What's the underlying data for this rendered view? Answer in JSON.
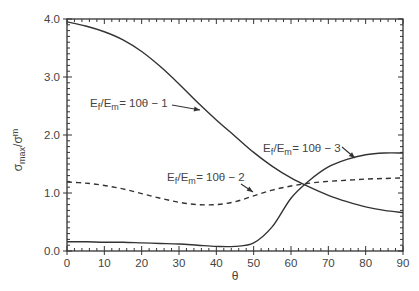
{
  "chart_data": {
    "type": "line",
    "title": "",
    "xlabel": "θ",
    "ylabel": "σmax/σm",
    "ylabel_parts": {
      "base": "σ",
      "sub": "max",
      "sep": "/σ",
      "sup": "m"
    },
    "xlim": [
      0,
      90
    ],
    "ylim": [
      0.0,
      4.0
    ],
    "x_ticks": [
      "0",
      "10",
      "20",
      "30",
      "40",
      "50",
      "60",
      "70",
      "80",
      "90"
    ],
    "y_ticks": [
      "0.0",
      "1.0",
      "2.0",
      "3.0",
      "4.0"
    ],
    "grid": false,
    "legend": "none (inline annotations with arrows)",
    "series": [
      {
        "name": "Ef/Em = 10θ - 1",
        "label_parts": {
          "a": "E",
          "a_sub": "f",
          "b": "/E",
          "b_sub": "m",
          "rest": " = 10θ − 1"
        },
        "style": "solid",
        "x": [
          0,
          5,
          10,
          15,
          20,
          25,
          30,
          35,
          40,
          45,
          50,
          55,
          60,
          65,
          70,
          75,
          80,
          85,
          90
        ],
        "y": [
          3.95,
          3.88,
          3.78,
          3.64,
          3.44,
          3.18,
          2.88,
          2.56,
          2.26,
          1.98,
          1.7,
          1.46,
          1.26,
          1.1,
          0.96,
          0.85,
          0.76,
          0.7,
          0.66
        ]
      },
      {
        "name": "Ef/Em = 10θ - 2",
        "label_parts": {
          "a": "E",
          "a_sub": "f",
          "b": "/E",
          "b_sub": "m",
          "rest": " = 10θ − 2"
        },
        "style": "dashed",
        "x": [
          0,
          5,
          10,
          15,
          20,
          25,
          30,
          35,
          40,
          45,
          50,
          55,
          60,
          65,
          70,
          75,
          80,
          85,
          90
        ],
        "y": [
          1.19,
          1.17,
          1.13,
          1.07,
          0.99,
          0.91,
          0.84,
          0.8,
          0.8,
          0.85,
          0.95,
          1.05,
          1.12,
          1.17,
          1.2,
          1.22,
          1.24,
          1.25,
          1.26
        ]
      },
      {
        "name": "Ef/Em = 10θ - 3",
        "label_parts": {
          "a": "E",
          "a_sub": "f",
          "b": "/E",
          "b_sub": "m",
          "rest": " = 10θ − 3"
        },
        "style": "solid",
        "x": [
          0,
          5,
          10,
          15,
          20,
          25,
          30,
          35,
          40,
          45,
          50,
          55,
          60,
          65,
          70,
          75,
          80,
          85,
          90
        ],
        "y": [
          0.16,
          0.16,
          0.15,
          0.15,
          0.14,
          0.13,
          0.12,
          0.1,
          0.08,
          0.08,
          0.14,
          0.42,
          0.91,
          1.22,
          1.45,
          1.58,
          1.66,
          1.69,
          1.69
        ]
      }
    ],
    "annotations": [
      {
        "series": 0,
        "text_x_px": 90,
        "text_y_px": 107,
        "arrow_from": [
          172,
          105
        ],
        "arrow_to": [
          200,
          110
        ]
      },
      {
        "series": 1,
        "text_x_px": 167,
        "text_y_px": 181,
        "arrow_from": [
          241,
          184
        ],
        "arrow_to": [
          253,
          192
        ]
      },
      {
        "series": 2,
        "text_x_px": 263,
        "text_y_px": 152,
        "arrow_from": [
          342,
          147
        ],
        "arrow_to": [
          355,
          158
        ]
      }
    ]
  },
  "colors": {
    "line": "#333333",
    "axis": "#333333",
    "text": "#444444",
    "background": "#ffffff"
  }
}
